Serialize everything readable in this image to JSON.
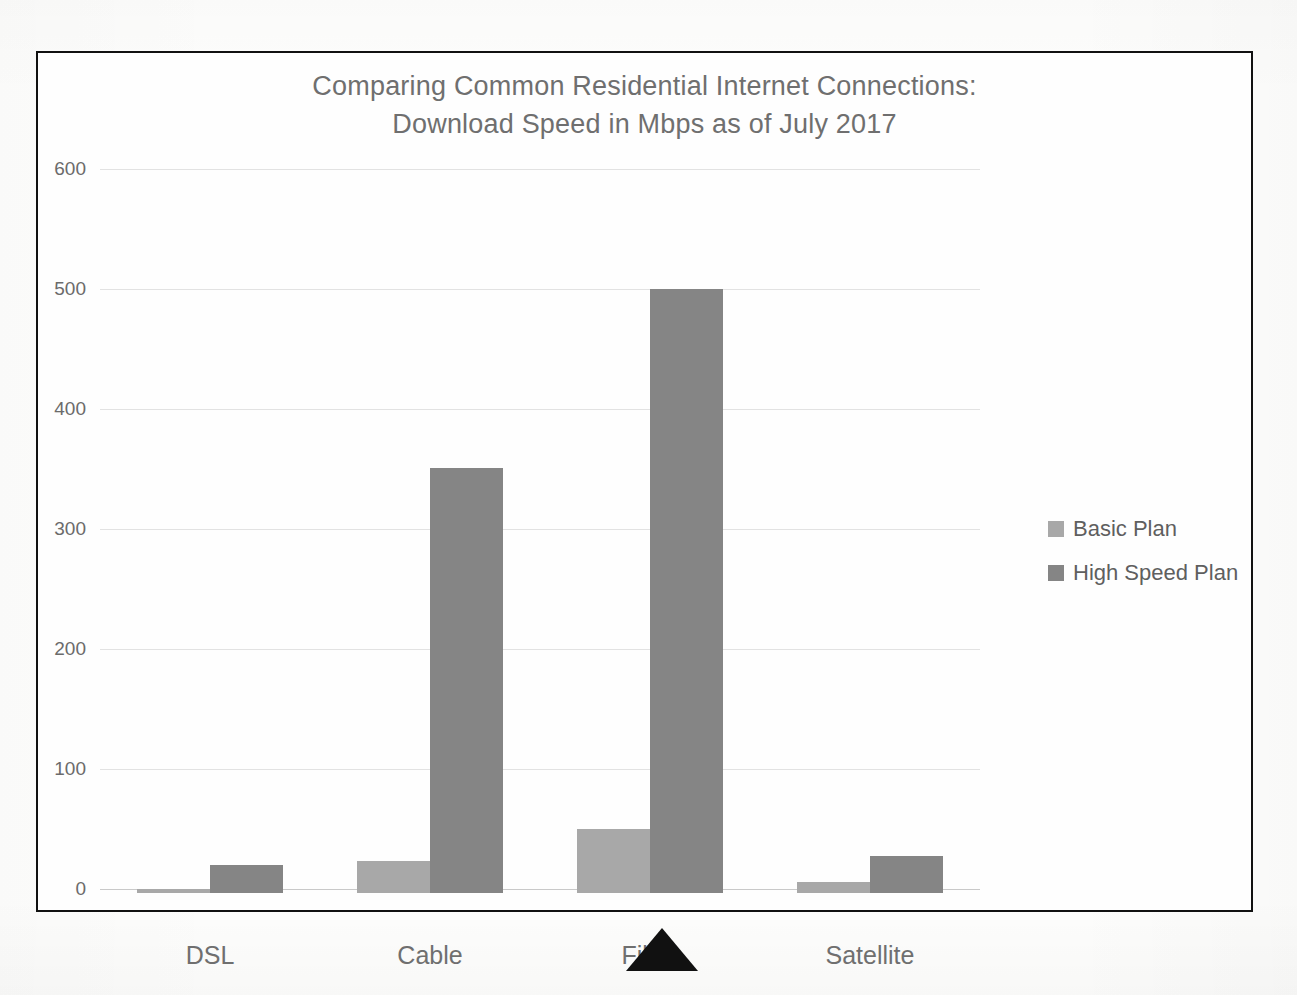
{
  "chart_data": {
    "type": "bar",
    "title": "Comparing Common Residential Internet Connections: Download Speed in Mbps as of July 2017",
    "title_line1": "Comparing Common Residential Internet Connections:",
    "title_line2": "Download Speed in Mbps as of July 2017",
    "xlabel": "",
    "ylabel": "",
    "ylim": [
      0,
      600
    ],
    "yticks": [
      0,
      100,
      200,
      300,
      400,
      500,
      600
    ],
    "ytick_labels": [
      "0",
      "100",
      "200",
      "300",
      "400",
      "500",
      "600"
    ],
    "grid": true,
    "legend_position": "right",
    "categories": [
      "DSL",
      "Cable",
      "Fiber",
      "Satellite"
    ],
    "series": [
      {
        "name": "Basic Plan",
        "color": "#a8a8a8",
        "values": [
          3,
          27,
          53,
          9
        ]
      },
      {
        "name": "High Speed Plan",
        "color": "#858585",
        "values": [
          23,
          354,
          503,
          31
        ]
      }
    ]
  },
  "legend": {
    "items": [
      {
        "label": "Basic Plan",
        "swatch": "basic"
      },
      {
        "label": "High Speed Plan",
        "swatch": "highspeed"
      }
    ]
  },
  "annotations": {
    "pointer_marker": "black-up-triangle"
  }
}
